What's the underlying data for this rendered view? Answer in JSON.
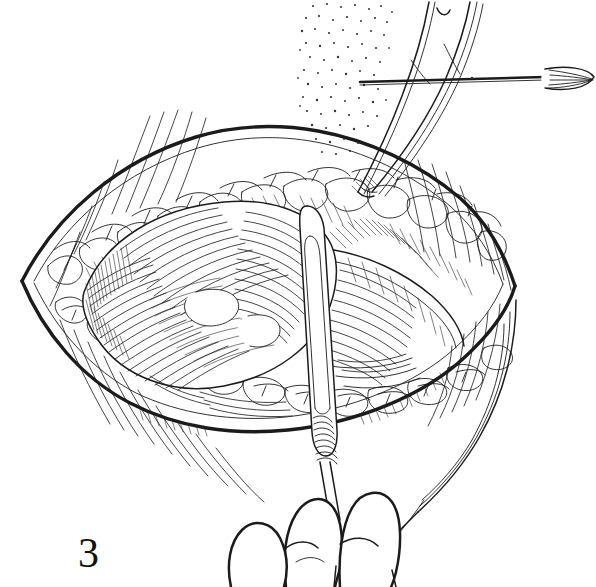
{
  "figure": {
    "number_label": "3",
    "caption": "",
    "domain": "surgical line-art illustration",
    "medium": "pen-and-ink line drawing, black ink on white",
    "background_color": "#ffffff",
    "ink_color": "#1b1b1b",
    "width": 596,
    "height": 587
  },
  "elements": {
    "wound": {
      "name": "open-surgical-incision",
      "shape": "lens / boat-shaped (elliptical) opening",
      "left_apex": {
        "x": 22,
        "y": 281
      },
      "right_apex": {
        "x": 515,
        "y": 286
      },
      "top_edge_peak": {
        "x": 268,
        "y": 133
      },
      "bottom_edge_trough": {
        "x": 262,
        "y": 424
      }
    },
    "fat_layer": {
      "name": "subcutaneous-fat-lobules",
      "description": "scalloped lobulated band lining both wound edges"
    },
    "deep_tissue": {
      "name": "exposed-muscle-fascia",
      "description": "densely cross-hatched dome of muscle occupying the wound floor"
    },
    "instruments": [
      {
        "name": "needle-probe",
        "description": "straight horizontal shaft entering from upper right with bulbous fanned tip at right margin",
        "orientation": "horizontal",
        "from": {
          "x": 360,
          "y": 82
        },
        "to": {
          "x": 596,
          "y": 77
        }
      },
      {
        "name": "tissue-forceps",
        "description": "two-pronged forceps descending from top, grasping fat at the upper wound edge",
        "orientation": "oblique, top to lower-left",
        "tip": {
          "x": 355,
          "y": 195
        }
      },
      {
        "name": "dissector-retractor",
        "description": "long flat-bladed instrument rising from the surgeon's fingers at bottom into the wound, knurled grip near the hand",
        "orientation": "near-vertical",
        "blade_tip": {
          "x": 312,
          "y": 205
        }
      }
    ],
    "hand": {
      "name": "surgeons-fingers",
      "description": "two to three fingers entering from the bottom edge gripping the dissector shaft",
      "count": 3
    },
    "shading": {
      "stipple_region": {
        "name": "stipple-shadow",
        "description": "dot-stippled shadow field in upper middle behind the forceps",
        "bounds": {
          "x": 300,
          "y": 0,
          "width": 90,
          "height": 160
        }
      },
      "skin_hatching": "fine curved parallel strokes radiating from wound margins over the surrounding skin"
    }
  }
}
